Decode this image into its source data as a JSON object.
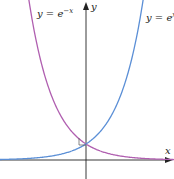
{
  "chart_data": {
    "type": "line",
    "title": "",
    "xlabel": "x",
    "ylabel": "y",
    "grid": false,
    "legend": "inline labels",
    "xlim": [
      -3.5,
      3.5
    ],
    "ylim": [
      -1.2,
      10
    ],
    "series": [
      {
        "name": "y = e^{-x}",
        "function": "exp(-x)",
        "color": "#b05fb0",
        "x": [
          -2.3,
          -2,
          -1.5,
          -1,
          -0.5,
          0,
          0.5,
          1,
          1.5,
          2,
          2.5,
          3,
          3.5
        ],
        "values": [
          9.97,
          7.39,
          4.48,
          2.72,
          1.65,
          1,
          0.61,
          0.37,
          0.22,
          0.14,
          0.08,
          0.05,
          0.03
        ]
      },
      {
        "name": "y = e^{x}",
        "function": "exp(x)",
        "color": "#5b8fd6",
        "x": [
          -3.5,
          -3,
          -2.5,
          -2,
          -1.5,
          -1,
          -0.5,
          0,
          0.5,
          1,
          1.5,
          2,
          2.3
        ],
        "values": [
          0.03,
          0.05,
          0.08,
          0.14,
          0.22,
          0.37,
          0.61,
          1,
          1.65,
          2.72,
          4.48,
          7.39,
          9.97
        ]
      }
    ],
    "annotations": [
      {
        "text": "intersection at (0, 1)",
        "x": 0,
        "y": 1
      }
    ]
  },
  "labels": {
    "left_curve": {
      "y": "y",
      "eq": " = ",
      "base": "e",
      "exp": "−x"
    },
    "right_curve": {
      "y": "y",
      "eq": " = ",
      "base": "e",
      "exp": "x"
    },
    "x_axis": "x",
    "y_axis": "y"
  },
  "colors": {
    "left_curve": "#b05fb0",
    "right_curve": "#5b8fd6",
    "axis": "#222222"
  }
}
